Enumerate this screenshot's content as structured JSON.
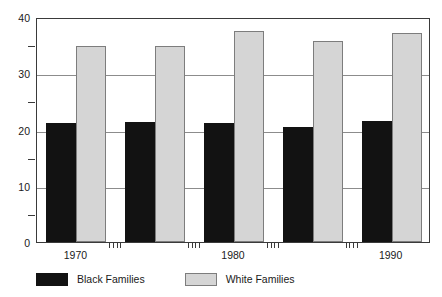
{
  "chart_data": {
    "type": "bar",
    "title": "",
    "subtitle": "",
    "xlabel": "",
    "ylabel": "",
    "ylim": [
      0,
      40
    ],
    "y_major_ticks": [
      0,
      10,
      20,
      30,
      40
    ],
    "y_minor_ticks": [
      5,
      15,
      25,
      35
    ],
    "grid": true,
    "grid_axis": "y",
    "legend_position": "below-axes-left",
    "categories": [
      "1970",
      "1975",
      "1980",
      "1985",
      "1990"
    ],
    "x_tick_labels": [
      "1970",
      "1980",
      "1990"
    ],
    "x_labeled_categories": [
      "1970",
      "1980",
      "1990"
    ],
    "series": [
      {
        "name": "Black Families",
        "color": "#121212",
        "values": [
          21.2,
          21.4,
          21.2,
          20.5,
          21.6
        ]
      },
      {
        "name": "White Families",
        "color": "#d5d5d5",
        "values": [
          34.8,
          34.9,
          37.6,
          35.7,
          37.1
        ]
      }
    ]
  },
  "axes": {
    "y_tick_labels": [
      "40",
      "30",
      "20",
      "10",
      "0"
    ],
    "minor_tick_count_between_groups": 4
  },
  "legend": {
    "items": [
      {
        "label": "Black Families",
        "swatch": "black-swatch"
      },
      {
        "label": "White Families",
        "swatch": "white-swatch"
      }
    ]
  }
}
